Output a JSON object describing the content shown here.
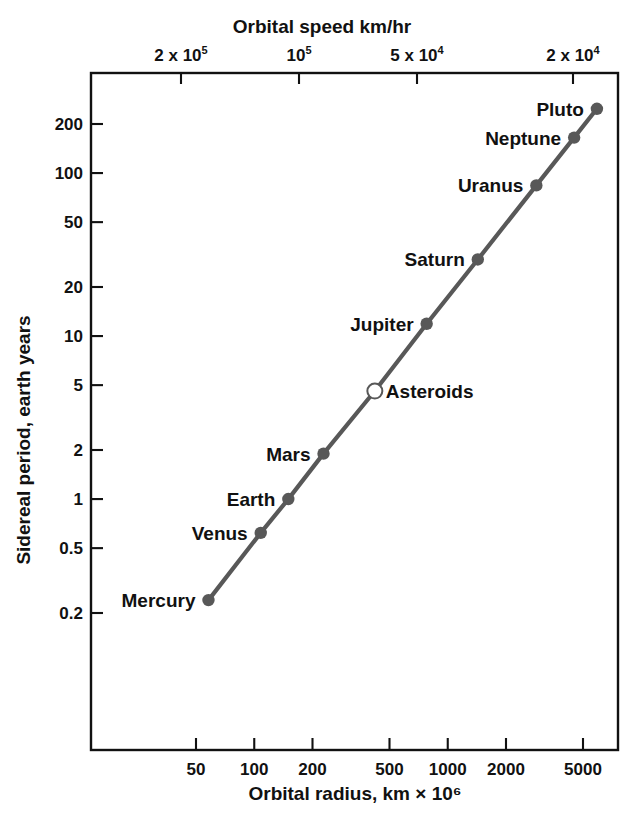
{
  "chart_data": {
    "type": "scatter",
    "title": "",
    "xlabel": "Orbital radius, km × 10⁶",
    "ylabel": "Sidereal period, earth years",
    "xlabel_top": "Orbital speed km/hr",
    "xscale": "log",
    "yscale": "log",
    "grid": false,
    "legend": "none",
    "xlim": [
      40,
      7000
    ],
    "ylim": [
      0.15,
      330
    ],
    "xticks": [
      "50",
      "100",
      "200",
      "500",
      "1000",
      "2000",
      "5000"
    ],
    "xtick_values": [
      50,
      100,
      200,
      500,
      1000,
      2000,
      5000
    ],
    "yticks": [
      "200",
      "100",
      "50",
      "20",
      "10",
      "5",
      "2",
      "1",
      "0.5",
      "0.2"
    ],
    "ytick_values": [
      200,
      100,
      50,
      20,
      10,
      5,
      2,
      1,
      0.5,
      0.2
    ],
    "top_xticks": [
      {
        "base": "2 x 10",
        "exp": "5"
      },
      {
        "base": "10",
        "exp": "5"
      },
      {
        "base": "5 x 10",
        "exp": "4"
      },
      {
        "base": "2 x 10",
        "exp": "4"
      }
    ],
    "top_xtick_values": [
      200000,
      100000,
      50000,
      20000
    ],
    "series": [
      {
        "name": "Solar system bodies",
        "marker_color": "#585858",
        "line_color": "#585858",
        "points": [
          {
            "label": "Mercury",
            "x": 58,
            "y": 0.24,
            "marker": "filled",
            "label_side": "left"
          },
          {
            "label": "Venus",
            "x": 108,
            "y": 0.62,
            "marker": "filled",
            "label_side": "left"
          },
          {
            "label": "Earth",
            "x": 150,
            "y": 1.0,
            "marker": "filled",
            "label_side": "left"
          },
          {
            "label": "Mars",
            "x": 228,
            "y": 1.9,
            "marker": "filled",
            "label_side": "left"
          },
          {
            "label": "Asteroids",
            "x": 420,
            "y": 4.6,
            "marker": "open",
            "label_side": "right"
          },
          {
            "label": "Jupiter",
            "x": 778,
            "y": 11.9,
            "marker": "filled",
            "label_side": "left"
          },
          {
            "label": "Saturn",
            "x": 1430,
            "y": 29.5,
            "marker": "filled",
            "label_side": "left"
          },
          {
            "label": "Uranus",
            "x": 2870,
            "y": 84.0,
            "marker": "filled",
            "label_side": "left"
          },
          {
            "label": "Neptune",
            "x": 4500,
            "y": 165.0,
            "marker": "filled",
            "label_side": "left"
          },
          {
            "label": "Pluto",
            "x": 5900,
            "y": 248.0,
            "marker": "filled",
            "label_side": "left"
          }
        ]
      }
    ]
  },
  "figure": {
    "axis_color": "#111111",
    "background": "#ffffff"
  }
}
